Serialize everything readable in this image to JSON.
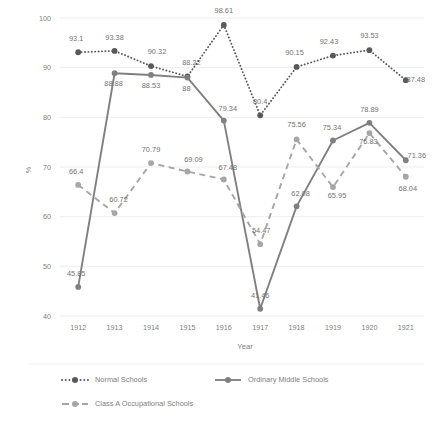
{
  "chart_data": {
    "type": "line",
    "title": "",
    "xlabel": "Year",
    "ylabel": "%",
    "categories": [
      "1912",
      "1913",
      "1914",
      "1915",
      "1916",
      "1917",
      "1918",
      "1919",
      "1920",
      "1921"
    ],
    "x": [
      1912,
      1913,
      1914,
      1915,
      1916,
      1917,
      1918,
      1919,
      1920,
      1921
    ],
    "ylim": [
      40,
      100
    ],
    "yticks": [
      40,
      50,
      60,
      70,
      80,
      90,
      100
    ],
    "grid": true,
    "legend_position": "bottom",
    "series": [
      {
        "name": "Normal Schools",
        "style": "dotted",
        "color": "#595959",
        "values": [
          93.1,
          93.38,
          90.32,
          88.22,
          98.61,
          80.4,
          90.15,
          92.43,
          93.53,
          87.48
        ],
        "labels": [
          "93.1",
          "93.38",
          "90.32",
          "88.22",
          "98.61",
          "80.4",
          "90.15",
          "92.43",
          "93.53",
          "87.48"
        ]
      },
      {
        "name": "Ordinary Middle Schools",
        "style": "solid",
        "color": "#808080",
        "values": [
          45.85,
          88.88,
          88.53,
          88,
          79.34,
          41.46,
          62.08,
          75.34,
          78.89,
          71.36
        ],
        "labels": [
          "45.85",
          "88.88",
          "88.53",
          "88",
          "79.34",
          "41.46",
          "62.08",
          "75.34",
          "78.89",
          "71.36"
        ]
      },
      {
        "name": "Class A Occupational Schools",
        "style": "dashed",
        "color": "#a6a6a6",
        "values": [
          66.4,
          60.72,
          70.79,
          69.09,
          67.48,
          54.47,
          75.56,
          65.95,
          76.83,
          68.04
        ],
        "labels": [
          "66.4",
          "60.72",
          "70.79",
          "69.09",
          "67.48",
          "54.47",
          "75.56",
          "65.95",
          "76.83",
          "68.04"
        ]
      }
    ],
    "label_offsets": [
      [
        [
          -2,
          -11
        ],
        [
          0,
          -11
        ],
        [
          6,
          -12
        ],
        [
          4,
          -12
        ],
        [
          0,
          -12
        ],
        [
          0,
          -11
        ],
        [
          -2,
          -12
        ],
        [
          -4,
          -12
        ],
        [
          0,
          -12
        ],
        [
          10,
          2
        ]
      ],
      [
        [
          -2,
          -11
        ],
        [
          -1,
          13
        ],
        [
          0,
          13
        ],
        [
          -1,
          13
        ],
        [
          4,
          -10
        ],
        [
          0,
          -11
        ],
        [
          4,
          -10
        ],
        [
          -1,
          -10
        ],
        [
          0,
          -11
        ],
        [
          11,
          -2
        ]
      ],
      [
        [
          -2,
          -11
        ],
        [
          4,
          -11
        ],
        [
          0,
          -11
        ],
        [
          6,
          -10
        ],
        [
          4,
          -10
        ],
        [
          1,
          -11
        ],
        [
          0,
          -12
        ],
        [
          4,
          11
        ],
        [
          -1,
          11
        ],
        [
          2,
          14
        ]
      ]
    ],
    "legend": [
      {
        "label": "Normal Schools",
        "style": "dotted",
        "color": "#595959"
      },
      {
        "label": "Ordinary Middle Schools",
        "style": "solid",
        "color": "#808080"
      },
      {
        "label": "Class A Occupational Schools",
        "style": "dashed",
        "color": "#a6a6a6"
      }
    ]
  }
}
